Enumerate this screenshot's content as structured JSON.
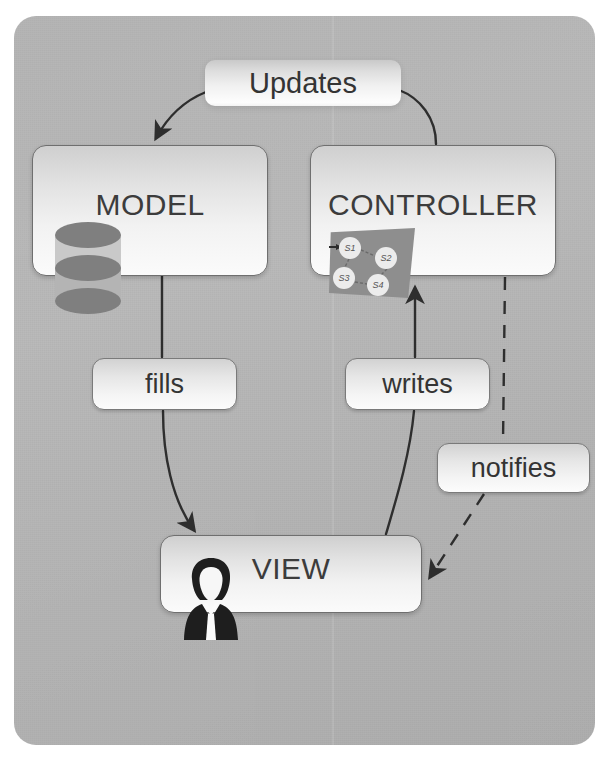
{
  "diagram": {
    "background_color": "#b5b5b5",
    "node_fill_top": "#cfcfcf",
    "node_fill_bottom": "#fbfbfb",
    "stroke_color": "#404040"
  },
  "nodes": {
    "model": {
      "label": "MODEL",
      "icon": "database-icon"
    },
    "controller": {
      "label": "CONTROLLER",
      "icon": "state-machine-icon",
      "states": [
        "S1",
        "S2",
        "S3",
        "S4"
      ]
    },
    "view": {
      "label": "VIEW",
      "icon": "person-icon"
    }
  },
  "edges": {
    "updates": {
      "label": "Updates",
      "from": "controller",
      "to": "model",
      "style": "solid-curved"
    },
    "fills": {
      "label": "fills",
      "from": "model",
      "to": "view",
      "style": "solid-curved"
    },
    "writes": {
      "label": "writes",
      "from": "view",
      "to": "controller",
      "style": "solid-curved"
    },
    "notifies": {
      "label": "notifies",
      "from": "controller",
      "to": "view",
      "style": "dashed"
    }
  }
}
